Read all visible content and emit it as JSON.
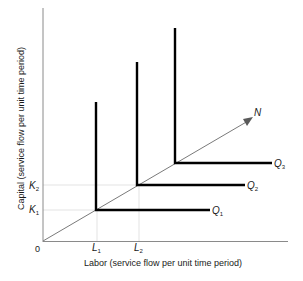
{
  "diagram": {
    "title": "",
    "origin_label": "0",
    "x_axis_label": "Labor (service flow per unit time period)",
    "y_axis_label": "Capital (service flow per unit time period)",
    "ray_label": "N",
    "x_ticks": [
      {
        "label": "L",
        "sub": "1"
      },
      {
        "label": "L",
        "sub": "2"
      }
    ],
    "y_ticks": [
      {
        "label": "K",
        "sub": "2"
      },
      {
        "label": "K",
        "sub": "1"
      }
    ],
    "isoquants": [
      {
        "label": "Q",
        "sub": "1"
      },
      {
        "label": "Q",
        "sub": "2"
      },
      {
        "label": "Q",
        "sub": "3"
      }
    ],
    "colors": {
      "axis": "#888888",
      "isoquant": "#000000",
      "ray": "#777777",
      "guide": "#d8d8d8",
      "text": "#1a1a1a"
    }
  }
}
